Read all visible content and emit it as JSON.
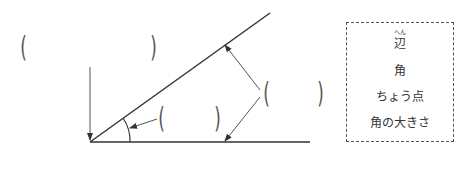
{
  "diagram": {
    "answer_blanks": [
      {
        "id": "blank-vertex",
        "open": "(",
        "close": ")"
      },
      {
        "id": "blank-angle",
        "open": "(",
        "close": ")"
      },
      {
        "id": "blank-sides",
        "open": "(",
        "close": ")"
      }
    ]
  },
  "word_bank": {
    "items": [
      {
        "label": "辺",
        "ruby": "へん"
      },
      {
        "label": "角"
      },
      {
        "label": "ちょう点"
      },
      {
        "label": "角の大きさ"
      }
    ]
  },
  "colors": {
    "line": "#333333",
    "arrow": "#555555",
    "border": "#555555"
  }
}
